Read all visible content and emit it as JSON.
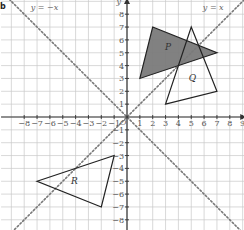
{
  "figure": {
    "corner_label": "b",
    "axes": {
      "x_label": "x",
      "y_label": "y",
      "origin_label": "O",
      "x_ticks": [
        -8,
        -7,
        -6,
        -5,
        -4,
        -3,
        -2,
        -1,
        1,
        2,
        3,
        4,
        5,
        6,
        7,
        8,
        9
      ],
      "y_ticks": [
        8,
        7,
        6,
        5,
        4,
        3,
        2,
        1,
        -1,
        -2,
        -3,
        -4,
        -5,
        -6,
        -7,
        -8
      ],
      "x_range": [
        -9.8,
        9.2
      ],
      "y_range": [
        -8.9,
        9.1
      ]
    },
    "lines": [
      {
        "name": "y = x",
        "label": "y = x",
        "slope": 1,
        "style": "dotted"
      },
      {
        "name": "y = -x",
        "label": "y = −x",
        "slope": -1,
        "style": "dotted"
      }
    ],
    "shapes": [
      {
        "name": "P",
        "label": "P",
        "vertices": [
          [
            2,
            7
          ],
          [
            7,
            5
          ],
          [
            1,
            3
          ]
        ],
        "fill": "#777777",
        "label_pos": [
          3.2,
          5.2
        ]
      },
      {
        "name": "Q",
        "label": "Q",
        "vertices": [
          [
            5,
            7
          ],
          [
            7,
            2
          ],
          [
            3,
            1
          ]
        ],
        "fill": "none",
        "label_pos": [
          5.1,
          2.8
        ]
      },
      {
        "name": "R",
        "label": "R",
        "vertices": [
          [
            -1,
            -3
          ],
          [
            -7,
            -5
          ],
          [
            -2,
            -7
          ]
        ],
        "fill": "none",
        "label_pos": [
          -4.1,
          -5.2
        ]
      }
    ],
    "colors": {
      "grid": "#c8c8c8",
      "axis": "#333333",
      "shaded": "#7a7a7a",
      "outline": "#222222",
      "dotted": "#777777"
    }
  }
}
